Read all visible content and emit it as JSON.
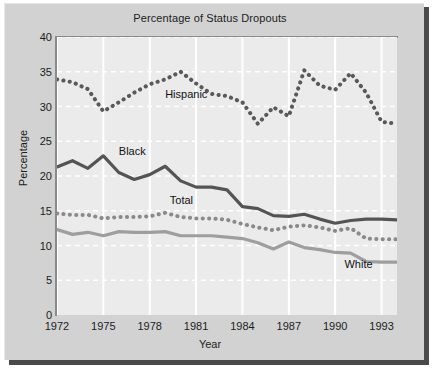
{
  "chart_data": {
    "type": "line",
    "title": "Percentage of Status Dropouts",
    "xlabel": "Year",
    "ylabel": "Percentage",
    "xlim": [
      1972,
      1994
    ],
    "ylim": [
      0,
      40
    ],
    "yticks": [
      0,
      5,
      10,
      15,
      20,
      25,
      30,
      35,
      40
    ],
    "xticks": [
      1972,
      1975,
      1978,
      1981,
      1984,
      1987,
      1990,
      1993
    ],
    "grid": true,
    "grid_color": "#ffffff",
    "legend": "inline-annotations",
    "x": [
      1972,
      1973,
      1974,
      1975,
      1976,
      1977,
      1978,
      1979,
      1980,
      1981,
      1982,
      1983,
      1984,
      1985,
      1986,
      1987,
      1988,
      1989,
      1990,
      1991,
      1992,
      1993,
      1994
    ],
    "series": [
      {
        "name": "Hispanic",
        "style": "dotted",
        "color": "#595959",
        "values": [
          33.9,
          33.5,
          32.5,
          29.3,
          30.6,
          32.0,
          33.2,
          33.9,
          35.0,
          33.3,
          31.8,
          31.5,
          30.6,
          27.5,
          29.9,
          28.6,
          35.2,
          33.0,
          32.4,
          34.8,
          32.0,
          27.8,
          27.5
        ]
      },
      {
        "name": "Black",
        "style": "solid",
        "color": "#545454",
        "values": [
          21.3,
          22.2,
          21.1,
          22.9,
          20.5,
          19.5,
          20.2,
          21.4,
          19.3,
          18.4,
          18.4,
          18.0,
          15.6,
          15.3,
          14.3,
          14.2,
          14.5,
          13.8,
          13.2,
          13.6,
          13.8,
          13.8,
          13.7
        ]
      },
      {
        "name": "Total",
        "style": "dotted",
        "color": "#8a8a8a",
        "values": [
          14.6,
          14.4,
          14.4,
          13.9,
          14.1,
          14.1,
          14.2,
          14.7,
          14.1,
          13.9,
          13.9,
          13.7,
          13.1,
          12.6,
          12.2,
          12.7,
          12.9,
          12.6,
          12.1,
          12.5,
          11.0,
          10.9,
          10.9
        ]
      },
      {
        "name": "White",
        "style": "solid",
        "color": "#9e9e9e",
        "values": [
          12.3,
          11.6,
          11.9,
          11.4,
          12.0,
          11.9,
          11.9,
          12.0,
          11.4,
          11.4,
          11.4,
          11.2,
          11.0,
          10.4,
          9.5,
          10.5,
          9.7,
          9.4,
          9.0,
          8.9,
          7.7,
          7.6,
          7.6
        ]
      }
    ],
    "annotations": [
      {
        "text": "Hispanic",
        "x": 1979.0,
        "y": 31.6
      },
      {
        "text": "Black",
        "x": 1976.0,
        "y": 23.4
      },
      {
        "text": "Total",
        "x": 1979.3,
        "y": 16.4
      },
      {
        "text": "White",
        "x": 1990.6,
        "y": 7.2
      }
    ]
  }
}
